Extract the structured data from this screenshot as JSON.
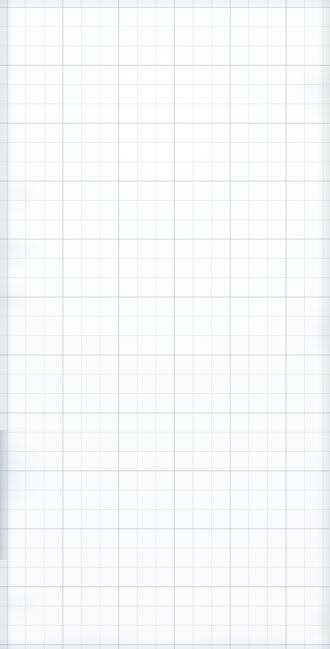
{
  "page": {
    "kind": "blank-grid-page",
    "title": "",
    "content_text": "",
    "is_empty": true,
    "width": 330,
    "height": 649
  },
  "canvas": {
    "background_color": "#ffffff",
    "paper_tint_color": "#f6f7f9"
  },
  "grid": {
    "visible": true,
    "minor": {
      "cell_width_px": 18.6,
      "cell_height_px": 19.32,
      "line_color": "#78828f",
      "line_opacity": 0.115,
      "line_width_px": 0.6,
      "offset_x_px": 6.6,
      "offset_y_px": 6.8,
      "columns": 18,
      "rows": 34
    },
    "major": {
      "cell_width_px": 55.8,
      "cell_height_px": 57.96,
      "line_color": "#6e7a8c",
      "line_opacity": 0.2,
      "line_width_px": 0.8,
      "every_n_minor": 3,
      "columns": 6,
      "rows": 12
    }
  },
  "edges": {
    "left_shadow_color": "#a8b0bc",
    "right_shadow_color": "#a8b0bc",
    "top_shadow_color": "#b0b7c2",
    "bottom_shadow_color": "#b0b7c2",
    "gutter_streak_color": "#969eac"
  }
}
